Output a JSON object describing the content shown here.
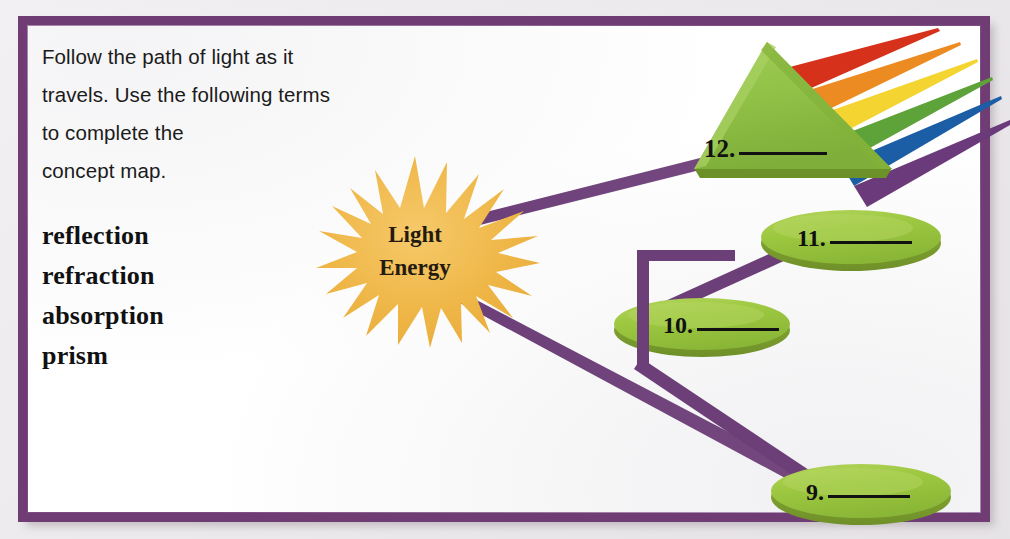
{
  "worksheet": {
    "instructions": [
      "Follow the path of light as it",
      "travels. Use the following terms",
      "to complete the",
      "concept map."
    ],
    "word_bank": [
      "reflection",
      "refraction",
      "absorption",
      "prism"
    ]
  },
  "diagram": {
    "type": "concept-map",
    "source_node": {
      "name": "sun-burst",
      "line1": "Light",
      "line2": "Energy",
      "shape": "starburst",
      "color": "#f0b84a"
    },
    "answer_nodes": [
      {
        "id": "n12",
        "number": "12.",
        "blank": "",
        "shape": "triangle",
        "color": "#8cc044",
        "meaning": "prism"
      },
      {
        "id": "n11",
        "number": "11.",
        "blank": "",
        "shape": "ellipse",
        "color": "#9ac93f",
        "meaning": "refraction"
      },
      {
        "id": "n10",
        "number": "10.",
        "blank": "",
        "shape": "ellipse",
        "color": "#9ac93f",
        "meaning": "reflection"
      },
      {
        "id": "n9",
        "number": "9.",
        "blank": "",
        "shape": "ellipse",
        "color": "#9ac93f",
        "meaning": "absorption"
      }
    ],
    "rainbow_rays": [
      {
        "name": "red-ray",
        "color": "#d5311b"
      },
      {
        "name": "orange-ray",
        "color": "#ec8b22"
      },
      {
        "name": "yellow-ray",
        "color": "#f3d431"
      },
      {
        "name": "green-ray",
        "color": "#5ea23a"
      },
      {
        "name": "blue-ray",
        "color": "#1c5ea6"
      },
      {
        "name": "violet-ray",
        "color": "#6b3a7a"
      }
    ],
    "connector_color": "#6c3f78",
    "border_color": "#6f3d74"
  }
}
